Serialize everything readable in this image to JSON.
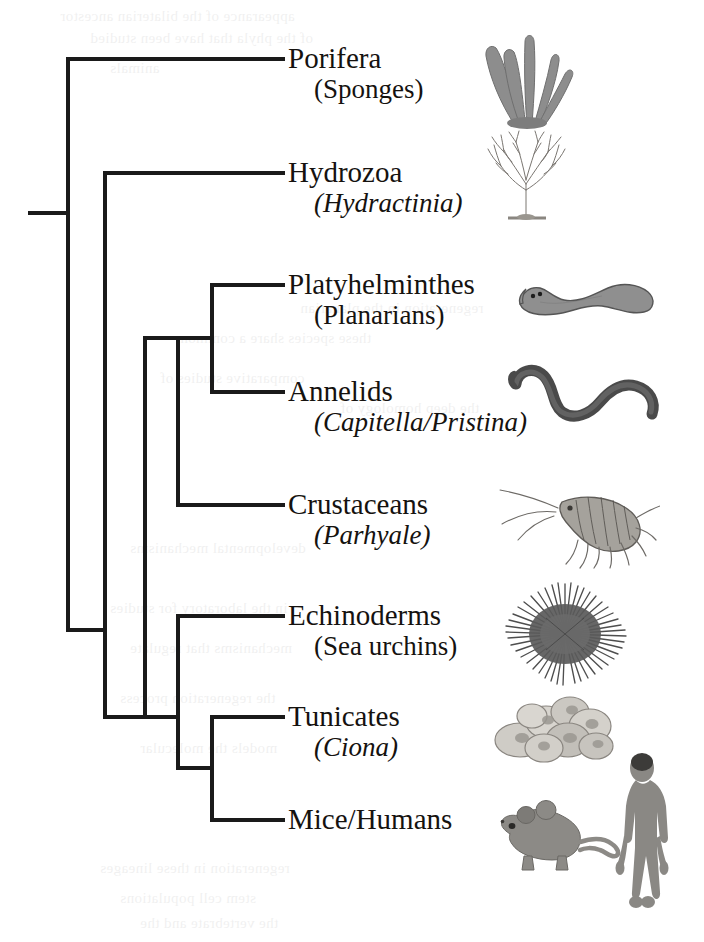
{
  "figure": {
    "type": "phylogenetic-cladogram",
    "orientation": "left-to-right",
    "line_color": "#1a1a1a",
    "text_color": "#15120f",
    "background": "#ffffff"
  },
  "taxa": [
    {
      "id": "porifera",
      "name": "Porifera",
      "subtitle": "(Sponges)",
      "subtitle_italic": false,
      "organism_icon": "sponge-icon",
      "tip_y": 59
    },
    {
      "id": "hydrozoa",
      "name": "Hydrozoa",
      "subtitle": "(Hydractinia)",
      "subtitle_italic": true,
      "organism_icon": "hydroid-colony-icon",
      "tip_y": 173
    },
    {
      "id": "platyhelminthes",
      "name": "Platyhelminthes",
      "subtitle": "(Planarians)",
      "subtitle_italic": false,
      "organism_icon": "planarian-icon",
      "tip_y": 285
    },
    {
      "id": "annelids",
      "name": "Annelids",
      "subtitle": "(Capitella/Pristina)",
      "subtitle_italic": true,
      "organism_icon": "annelid-worm-icon",
      "tip_y": 392
    },
    {
      "id": "crustaceans",
      "name": "Crustaceans",
      "subtitle": "(Parhyale)",
      "subtitle_italic": true,
      "organism_icon": "amphipod-icon",
      "tip_y": 505
    },
    {
      "id": "echinoderms",
      "name": "Echinoderms",
      "subtitle": "(Sea urchins)",
      "subtitle_italic": false,
      "organism_icon": "sea-urchin-icon",
      "tip_y": 616
    },
    {
      "id": "tunicates",
      "name": "Tunicates",
      "subtitle": "(Ciona)",
      "subtitle_italic": true,
      "organism_icon": "tunicate-colony-icon",
      "tip_y": 717
    },
    {
      "id": "mice_humans",
      "name": "Mice/Humans",
      "subtitle": "",
      "subtitle_italic": false,
      "organism_icon": "mouse-and-human-icon",
      "tip_y": 820
    }
  ],
  "tree_geometry": {
    "root_stub_x_start": 28,
    "root_x": 68,
    "tip_x": 285,
    "nodes": [
      {
        "id": "root",
        "x": 68,
        "y_top": 59,
        "y_bottom": 630,
        "note": "Porifera vs rest"
      },
      {
        "id": "eumetazoa",
        "x": 105,
        "y_top": 173,
        "y_bottom": 717,
        "note": "Hydrozoa vs bilateria"
      },
      {
        "id": "bilateria",
        "x": 145,
        "y_top": 338,
        "y_bottom": 717,
        "note": "protostomes vs deuterostomes"
      },
      {
        "id": "protostomes",
        "x": 178,
        "y_top": 338,
        "y_bottom": 505,
        "note": "lophotrochozoa vs crustaceans"
      },
      {
        "id": "lophotrochozoa",
        "x": 212,
        "y_top": 285,
        "y_bottom": 392,
        "note": "platyhelminthes vs annelids"
      },
      {
        "id": "deuterostomes",
        "x": 178,
        "y_top": 616,
        "y_bottom": 768,
        "note": "echinoderms vs chordates"
      },
      {
        "id": "chordates",
        "x": 212,
        "y_top": 717,
        "y_bottom": 820,
        "note": "tunicates vs vertebrates"
      }
    ]
  },
  "bleed_text": [
    {
      "text": "appearance of the bilaterian ancestor",
      "x": 60,
      "y": 8
    },
    {
      "text": "of the phyla that have been studied",
      "x": 90,
      "y": 30
    },
    {
      "text": "animals",
      "x": 110,
      "y": 60
    },
    {
      "text": "regeneration in the planarian",
      "x": 300,
      "y": 300
    },
    {
      "text": "these species share a common",
      "x": 180,
      "y": 330
    },
    {
      "text": "comparative studies of",
      "x": 160,
      "y": 370
    },
    {
      "text": "the deep homology of",
      "x": 340,
      "y": 400
    },
    {
      "text": "developmental mechanisms",
      "x": 130,
      "y": 540
    },
    {
      "text": "in the laboratory for studies",
      "x": 110,
      "y": 600
    },
    {
      "text": "mechanisms that regulate",
      "x": 130,
      "y": 640
    },
    {
      "text": "the regeneration process",
      "x": 120,
      "y": 690
    },
    {
      "text": "models the molecular",
      "x": 140,
      "y": 740
    },
    {
      "text": "regeneration in these lineages",
      "x": 100,
      "y": 860
    },
    {
      "text": "stem cell populations",
      "x": 120,
      "y": 890
    },
    {
      "text": "the vertebrate and the",
      "x": 140,
      "y": 915
    }
  ]
}
